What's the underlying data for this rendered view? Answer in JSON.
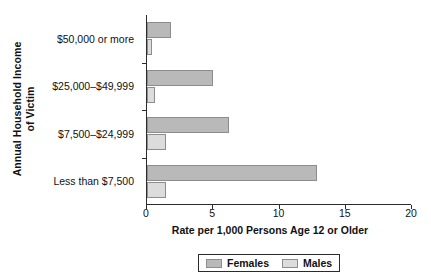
{
  "chart_data": {
    "type": "bar",
    "orientation": "horizontal",
    "title": "",
    "xlabel": "Rate per 1,000 Persons Age 12 or Older",
    "ylabel": "Annual Household Income of Victim",
    "ylabel_lines": [
      "Annual Household Income",
      "of Victim"
    ],
    "categories": [
      "$50,000 or more",
      "$25,000–$49,999",
      "$7,500–$24,999",
      "Less than $7,500"
    ],
    "series": [
      {
        "name": "Females",
        "color": "#b9b9b9",
        "values": [
          1.8,
          5.0,
          6.2,
          12.8
        ]
      },
      {
        "name": "Males",
        "color": "#dcdcdc",
        "values": [
          0.4,
          0.6,
          1.4,
          1.4
        ]
      }
    ],
    "xlim": [
      0,
      20
    ],
    "xticks": [
      0,
      5,
      10,
      15,
      20
    ],
    "xtick_labels": [
      "0",
      "5",
      "10",
      "15",
      "20"
    ],
    "grid": false,
    "legend": {
      "position": "bottom",
      "entries": [
        "Females",
        "Males"
      ]
    }
  },
  "legend": {
    "entries": [
      {
        "label": "Females",
        "color": "#b9b9b9"
      },
      {
        "label": "Males",
        "color": "#dcdcdc"
      }
    ]
  }
}
